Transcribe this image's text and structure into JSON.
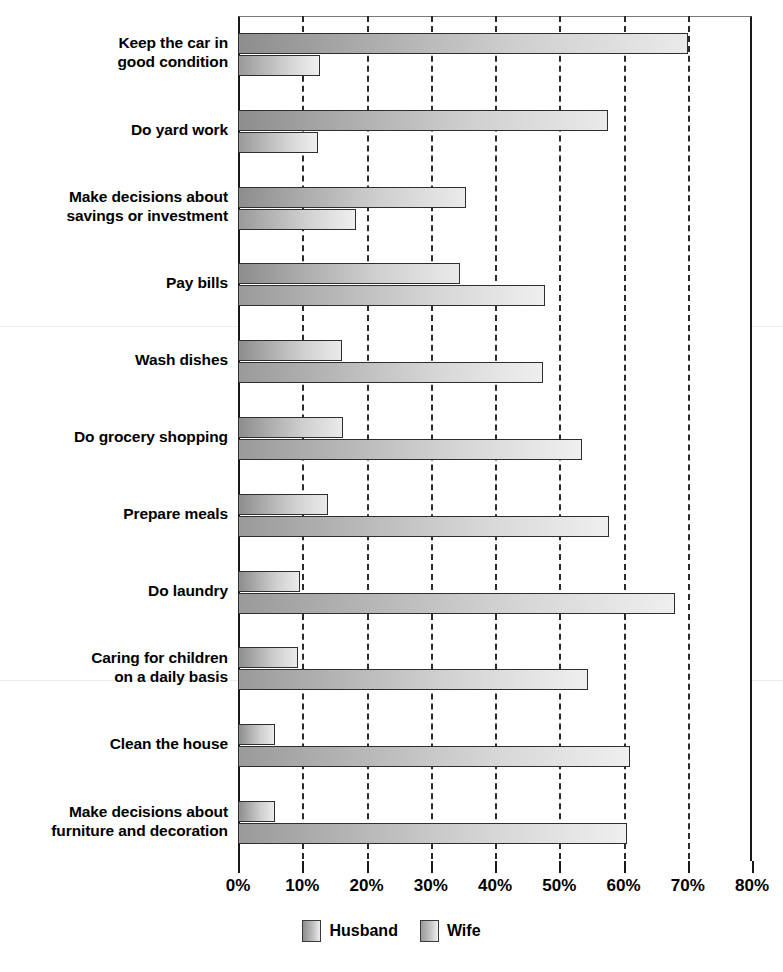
{
  "chart_data": {
    "type": "bar",
    "orientation": "horizontal",
    "title": "",
    "subtitle": "",
    "xlabel": "",
    "ylabel": "",
    "xlim": [
      0,
      80
    ],
    "xticks": [
      0,
      10,
      20,
      30,
      40,
      50,
      60,
      70,
      80
    ],
    "xtick_labels": [
      "0%",
      "10%",
      "20%",
      "30%",
      "40%",
      "50%",
      "60%",
      "70%",
      "80%"
    ],
    "grid": "vertical-dashed",
    "legend_position": "bottom-center",
    "categories": [
      "Keep the car in good condition",
      "Do yard work",
      "Make decisions about savings or investment",
      "Pay bills",
      "Wash dishes",
      "Do grocery shopping",
      "Prepare meals",
      "Do laundry",
      "Caring for children on a daily basis",
      "Clean the house",
      "Make decisions about furniture and decoration"
    ],
    "category_lines": [
      [
        "Keep the car in",
        "good condition"
      ],
      [
        "Do yard work"
      ],
      [
        "Make decisions about",
        "savings or investment"
      ],
      [
        "Pay bills"
      ],
      [
        "Wash dishes"
      ],
      [
        "Do grocery shopping"
      ],
      [
        "Prepare meals"
      ],
      [
        "Do laundry"
      ],
      [
        "Caring for children",
        "on a daily basis"
      ],
      [
        "Clean the house"
      ],
      [
        "Make decisions about",
        "furniture and decoration"
      ]
    ],
    "series": [
      {
        "name": "Husband",
        "color": "#bcbcbc",
        "values": [
          70.0,
          57.6,
          35.5,
          34.6,
          16.2,
          16.3,
          14.0,
          9.7,
          9.3,
          5.8,
          5.8
        ]
      },
      {
        "name": "Wife",
        "color": "#c4c4c4",
        "values": [
          12.8,
          12.5,
          18.4,
          47.8,
          47.5,
          53.5,
          57.8,
          68.0,
          54.5,
          61.0,
          60.6
        ]
      }
    ]
  },
  "legend": {
    "items": [
      {
        "label": "Husband",
        "swatch": "husband-swatch"
      },
      {
        "label": "Wife",
        "swatch": "wife-swatch"
      }
    ]
  }
}
